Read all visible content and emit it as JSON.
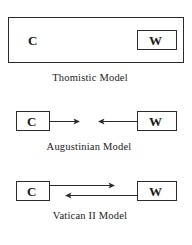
{
  "models": [
    {
      "id": "thomistic",
      "label": "Thomistic Model",
      "church_label": "C",
      "world_label": "W",
      "relation": "world contained within church"
    },
    {
      "id": "augustinian",
      "label": "Augustinian Model",
      "church_label": "C",
      "world_label": "W",
      "relation": "opposing arrows pointing toward each other, not meeting"
    },
    {
      "id": "vatican2",
      "label": "Vatican II Model",
      "church_label": "C",
      "world_label": "W",
      "relation": "two-way exchange: C to W and W to C"
    }
  ],
  "colors": {
    "background": "#ffffff",
    "stroke": "#2a2a2a",
    "text": "#1a1a1a"
  }
}
